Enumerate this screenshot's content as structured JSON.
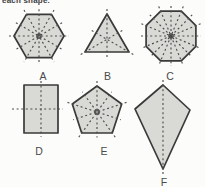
{
  "page": {
    "width": 205,
    "height": 187
  },
  "colors": {
    "background": "#fcfcfb",
    "shape_fill": "#d9d9d6",
    "shape_stroke": "#3a3a3a",
    "symmetry_line": "#4f4f4f",
    "label_text": "#4a4a4a"
  },
  "figure": {
    "instruction_fragment": "each shape.",
    "shapes": [
      {
        "label": "A",
        "shape": "regular hexagon",
        "symmetry_line_count": 6,
        "polygon": [
          [
            64,
            36
          ],
          [
            51.5,
            57.7
          ],
          [
            26.5,
            57.7
          ],
          [
            14,
            36
          ],
          [
            26.5,
            14.3
          ],
          [
            51.5,
            14.3
          ]
        ],
        "symmetry_segments": [
          [
            9,
            36,
            69,
            36
          ],
          [
            24,
            10,
            54,
            62
          ],
          [
            54,
            10,
            24,
            62
          ],
          [
            15.9,
            22.7,
            62.1,
            49.3
          ],
          [
            39,
            9.3,
            39,
            62.7
          ],
          [
            62.1,
            22.7,
            15.9,
            49.3
          ]
        ],
        "center_mark": [
          39,
          36
        ],
        "label_pos": [
          43,
          80
        ]
      },
      {
        "label": "B",
        "shape": "equilateral triangle",
        "symmetry_line_count": 3,
        "polygon": [
          [
            107,
            14
          ],
          [
            129,
            52
          ],
          [
            85,
            52
          ]
        ],
        "symmetry_segments": [
          [
            107,
            9,
            107,
            57
          ],
          [
            80.7,
            54.5,
            122.3,
            30.5
          ],
          [
            133.3,
            54.5,
            91.7,
            30.5
          ]
        ],
        "center_mark": null,
        "label_pos": [
          107.5,
          80
        ]
      },
      {
        "label": "C",
        "shape": "regular octagon",
        "symmetry_line_count": 8,
        "polygon": [
          [
            195.9,
            46.3
          ],
          [
            181.3,
            60.9
          ],
          [
            160.7,
            60.9
          ],
          [
            146.1,
            46.3
          ],
          [
            146.1,
            25.7
          ],
          [
            160.7,
            11.1
          ],
          [
            181.3,
            11.1
          ],
          [
            195.9,
            25.7
          ]
        ],
        "symmetry_segments": [
          [
            141,
            36,
            201,
            36
          ],
          [
            171,
            6,
            171,
            66
          ],
          [
            149.8,
            14.8,
            192.2,
            57.2
          ],
          [
            192.2,
            14.8,
            149.8,
            57.2
          ],
          [
            141.4,
            23.7,
            200.6,
            48.3
          ],
          [
            158.7,
            6.4,
            183.3,
            65.6
          ],
          [
            183.3,
            6.4,
            158.7,
            65.6
          ],
          [
            200.6,
            23.7,
            141.4,
            48.3
          ]
        ],
        "center_mark": [
          171,
          36
        ],
        "label_pos": [
          170,
          80
        ]
      },
      {
        "label": "D",
        "shape": "rectangle",
        "symmetry_line_count": 2,
        "polygon": [
          [
            24,
            85
          ],
          [
            58,
            85
          ],
          [
            58,
            133
          ],
          [
            24,
            133
          ]
        ],
        "symmetry_segments": [
          [
            41,
            81,
            41,
            137
          ],
          [
            12,
            109,
            63,
            109
          ]
        ],
        "center_mark": null,
        "label_pos": [
          39,
          155
        ]
      },
      {
        "label": "E",
        "shape": "regular pentagon",
        "symmetry_line_count": 5,
        "polygon": [
          [
            97,
            86
          ],
          [
            121.7,
            104
          ],
          [
            112.3,
            133
          ],
          [
            81.7,
            133
          ],
          [
            72.3,
            104
          ]
        ],
        "symmetry_segments": [
          [
            97,
            81,
            97,
            137.5
          ],
          [
            126.5,
            102.4,
            73.2,
            119.7
          ],
          [
            115.2,
            137.1,
            82.3,
            91.8
          ],
          [
            78.8,
            137.1,
            111.7,
            91.8
          ],
          [
            67.5,
            102.4,
            120.8,
            119.7
          ]
        ],
        "center_mark": [
          97,
          112
        ],
        "label_pos": [
          104,
          155
        ]
      },
      {
        "label": "F",
        "shape": "kite",
        "symmetry_line_count": 1,
        "polygon": [
          [
            163,
            85
          ],
          [
            190,
            110
          ],
          [
            163,
            169
          ],
          [
            135,
            109
          ]
        ],
        "symmetry_segments": [
          [
            163,
            80,
            163,
            174
          ]
        ],
        "center_mark": null,
        "label_pos": [
          164,
          186
        ]
      }
    ]
  }
}
